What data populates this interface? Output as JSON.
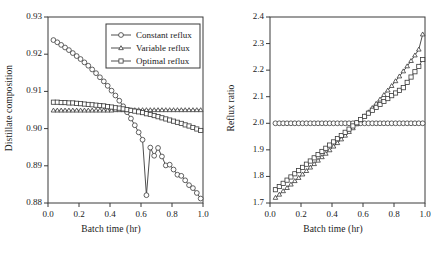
{
  "figure": {
    "background": "#ffffff",
    "line_color": "#3a3a3a",
    "marker_fill": "#ffffff",
    "panels": [
      "distillate-composition",
      "reflux-ratio"
    ]
  },
  "legend": {
    "position": "upper-right-of-left-panel",
    "border_color": "#3a3a3a",
    "entries": [
      {
        "label": "Constant reflux",
        "marker": "circle"
      },
      {
        "label": "Variable reflux",
        "marker": "triangle"
      },
      {
        "label": "Optimal reflux",
        "marker": "square"
      }
    ]
  },
  "chart_data": [
    {
      "type": "line",
      "id": "distillate-composition",
      "title": "",
      "xlabel": "Batch time (hr)",
      "ylabel": "Distillate composition",
      "xlim": [
        0.0,
        1.0
      ],
      "ylim": [
        0.88,
        0.93
      ],
      "xticks": [
        "0.0",
        "0.2",
        "0.4",
        "0.6",
        "0.8",
        "1.0"
      ],
      "xtick_values": [
        0.0,
        0.2,
        0.4,
        0.6,
        0.8,
        1.0
      ],
      "yticks": [
        "0.88",
        "0.89",
        "0.90",
        "0.91",
        "0.92",
        "0.93"
      ],
      "ytick_values": [
        0.88,
        0.89,
        0.9,
        0.91,
        0.92,
        0.93
      ],
      "grid": false,
      "legend_position": "upper right",
      "x": [
        0.035,
        0.06,
        0.085,
        0.11,
        0.135,
        0.16,
        0.185,
        0.21,
        0.235,
        0.26,
        0.285,
        0.31,
        0.335,
        0.36,
        0.385,
        0.41,
        0.435,
        0.46,
        0.485,
        0.51,
        0.535,
        0.56,
        0.585,
        0.61,
        0.635,
        0.66,
        0.685,
        0.71,
        0.735,
        0.76,
        0.785,
        0.81,
        0.835,
        0.86,
        0.885,
        0.91,
        0.935,
        0.96,
        0.985
      ],
      "series": [
        {
          "name": "Constant reflux",
          "marker": "circle",
          "values": [
            0.9238,
            0.9232,
            0.9225,
            0.9218,
            0.9211,
            0.9203,
            0.9195,
            0.9187,
            0.9178,
            0.9169,
            0.9159,
            0.9149,
            0.9138,
            0.9127,
            0.9115,
            0.9102,
            0.9089,
            0.9075,
            0.906,
            0.9044,
            0.9027,
            0.9009,
            0.899,
            0.897,
            0.8821,
            0.8949,
            0.8927,
            0.8948,
            0.8925,
            0.8901,
            0.8903,
            0.889,
            0.8876,
            0.8873,
            0.8861,
            0.8848,
            0.884,
            0.8827,
            0.8812
          ]
        },
        {
          "name": "Variable reflux",
          "marker": "triangle",
          "values": [
            0.9049,
            0.9049,
            0.9049,
            0.9049,
            0.9049,
            0.9049,
            0.9049,
            0.9049,
            0.9049,
            0.9049,
            0.9049,
            0.9049,
            0.9049,
            0.9049,
            0.9049,
            0.9049,
            0.905,
            0.905,
            0.905,
            0.905,
            0.905,
            0.905,
            0.905,
            0.905,
            0.905,
            0.905,
            0.905,
            0.905,
            0.905,
            0.905,
            0.905,
            0.905,
            0.905,
            0.905,
            0.905,
            0.905,
            0.905,
            0.905,
            0.905
          ]
        },
        {
          "name": "Optimal reflux",
          "marker": "square",
          "values": [
            0.9071,
            0.9071,
            0.907,
            0.907,
            0.9069,
            0.9069,
            0.9068,
            0.9067,
            0.9066,
            0.9065,
            0.9064,
            0.9063,
            0.9062,
            0.9061,
            0.9059,
            0.9058,
            0.9056,
            0.9055,
            0.9053,
            0.9051,
            0.9049,
            0.9047,
            0.9045,
            0.9043,
            0.904,
            0.9038,
            0.9035,
            0.9032,
            0.9029,
            0.9026,
            0.9023,
            0.902,
            0.9017,
            0.9014,
            0.901,
            0.9007,
            0.9003,
            0.8999,
            0.8995
          ]
        }
      ]
    },
    {
      "type": "line",
      "id": "reflux-ratio",
      "title": "",
      "xlabel": "Batch time (hr)",
      "ylabel": "Reflux ratio",
      "xlim": [
        0.0,
        1.0
      ],
      "ylim": [
        1.7,
        2.4
      ],
      "xticks": [
        "0.0",
        "0.2",
        "0.4",
        "0.6",
        "0.8",
        "1.0"
      ],
      "xtick_values": [
        0.0,
        0.2,
        0.4,
        0.6,
        0.8,
        1.0
      ],
      "yticks": [
        "1.7",
        "1.8",
        "1.9",
        "2.0",
        "2.1",
        "2.2",
        "2.3",
        "2.4"
      ],
      "ytick_values": [
        1.7,
        1.8,
        1.9,
        2.0,
        2.1,
        2.2,
        2.3,
        2.4
      ],
      "grid": false,
      "legend_position": "none",
      "x": [
        0.035,
        0.06,
        0.085,
        0.11,
        0.135,
        0.16,
        0.185,
        0.21,
        0.235,
        0.26,
        0.285,
        0.31,
        0.335,
        0.36,
        0.385,
        0.41,
        0.435,
        0.46,
        0.485,
        0.51,
        0.535,
        0.56,
        0.585,
        0.61,
        0.635,
        0.66,
        0.685,
        0.71,
        0.735,
        0.76,
        0.785,
        0.81,
        0.835,
        0.86,
        0.885,
        0.91,
        0.935,
        0.96,
        0.985
      ],
      "series": [
        {
          "name": "Constant reflux",
          "marker": "circle",
          "values": [
            2.0,
            2.0,
            2.0,
            2.0,
            2.0,
            2.0,
            2.0,
            2.0,
            2.0,
            2.0,
            2.0,
            2.0,
            2.0,
            2.0,
            2.0,
            2.0,
            2.0,
            2.0,
            2.0,
            2.0,
            2.0,
            2.0,
            2.0,
            2.0,
            2.0,
            2.0,
            2.0,
            2.0,
            2.0,
            2.0,
            2.0,
            2.0,
            2.0,
            2.0,
            2.0,
            2.0,
            2.0,
            2.0,
            2.0
          ]
        },
        {
          "name": "Variable reflux",
          "marker": "triangle",
          "values": [
            1.72,
            1.732,
            1.745,
            1.757,
            1.77,
            1.783,
            1.795,
            1.808,
            1.821,
            1.834,
            1.847,
            1.86,
            1.873,
            1.886,
            1.899,
            1.913,
            1.926,
            1.94,
            1.954,
            1.968,
            1.982,
            1.997,
            2.012,
            2.027,
            2.042,
            2.058,
            2.074,
            2.09,
            2.107,
            2.124,
            2.141,
            2.159,
            2.177,
            2.196,
            2.215,
            2.235,
            2.256,
            2.278,
            2.335
          ]
        },
        {
          "name": "Optimal reflux",
          "marker": "square",
          "values": [
            1.75,
            1.762,
            1.774,
            1.786,
            1.798,
            1.81,
            1.822,
            1.834,
            1.846,
            1.858,
            1.87,
            1.882,
            1.894,
            1.906,
            1.918,
            1.93,
            1.942,
            1.954,
            1.966,
            1.978,
            1.99,
            2.002,
            2.014,
            2.026,
            2.038,
            2.049,
            2.06,
            2.071,
            2.082,
            2.093,
            2.104,
            2.114,
            2.124,
            2.134,
            2.154,
            2.174,
            2.194,
            2.214,
            2.24
          ]
        }
      ]
    }
  ]
}
